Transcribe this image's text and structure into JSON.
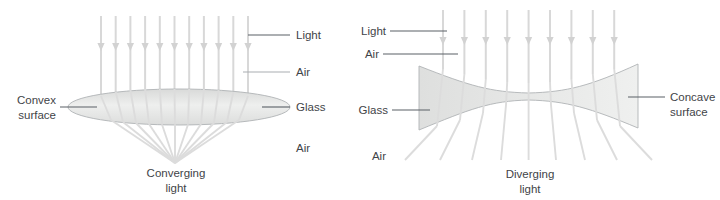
{
  "figure": {
    "background": "#ffffff",
    "ray_color": "#dcdcdc",
    "glass_fill": "#e3e4e3",
    "label_color": "#3f4448",
    "leader_color": "#5a6066"
  },
  "panels": [
    {
      "id": "convex",
      "lens_type": "convex",
      "caption": {
        "line1": "Converging",
        "line2": "light"
      },
      "labels": {
        "left_surface_line1": "Convex",
        "left_surface_line2": "surface",
        "light": "Light",
        "air_top": "Air",
        "glass": "Glass",
        "air_bottom": "Air"
      },
      "ray_count": 11,
      "focal_point": {
        "x": 175,
        "y": 163
      },
      "lens": {
        "cx": 179,
        "cy": 107,
        "rx": 111,
        "ry": 18
      }
    },
    {
      "id": "concave",
      "lens_type": "concave",
      "caption": {
        "line1": "Diverging",
        "line2": "light"
      },
      "labels": {
        "light": "Light",
        "air_top": "Air",
        "glass": "Glass",
        "air_bottom": "Air",
        "right_surface_line1": "Concave",
        "right_surface_line2": "surface"
      },
      "ray_count": 9,
      "lens": {
        "left_x": 419,
        "right_x": 638,
        "top_y": 65,
        "bottom_y": 129
      }
    }
  ]
}
